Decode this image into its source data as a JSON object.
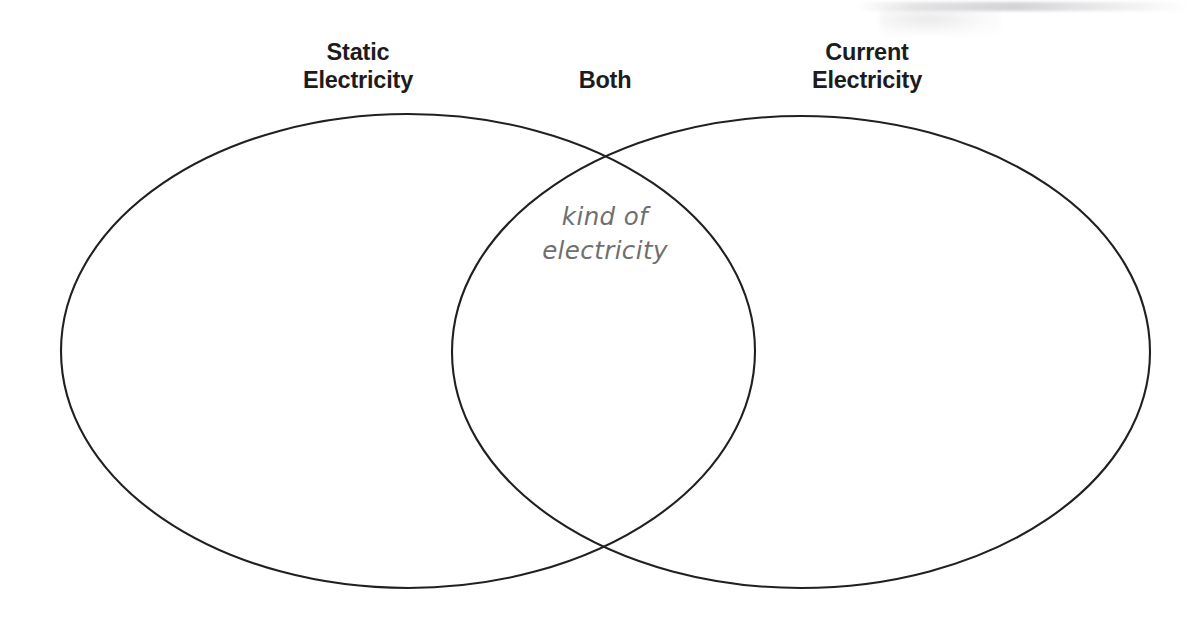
{
  "diagram": {
    "type": "venn",
    "background_color": "#ffffff",
    "outline_color": "#231f20",
    "labels": {
      "left": "Static\nElectricity",
      "center": "Both",
      "right": "Current\nElectricity"
    },
    "label_color": "#1c1c1c",
    "sets": [
      {
        "name": "left-set",
        "label": "Static Electricity",
        "items": []
      },
      {
        "name": "right-set",
        "label": "Current Electricity",
        "items": []
      }
    ],
    "intersection": {
      "label": "Both",
      "note": "kind of\nelectricity",
      "note_color": "#6f6f70",
      "items": [
        "kind of electricity"
      ]
    },
    "geometry": {
      "left_ellipse": {
        "cx": 408,
        "cy": 351,
        "rx": 347,
        "ry": 237
      },
      "right_ellipse": {
        "cx": 801,
        "cy": 352,
        "rx": 349,
        "ry": 236
      }
    }
  }
}
